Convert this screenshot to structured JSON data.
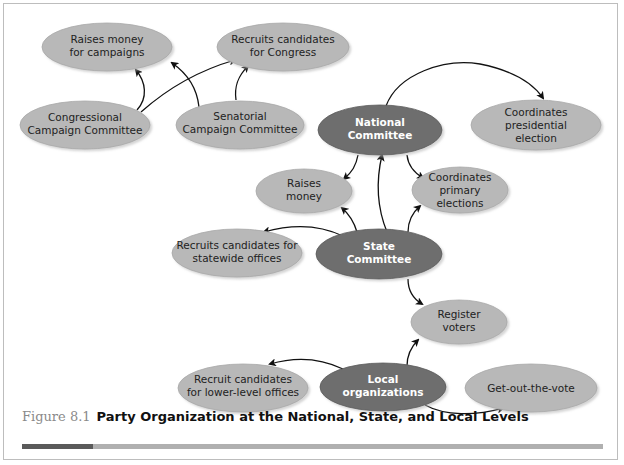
{
  "colors": {
    "light_node": "#b8b8b8",
    "light_node_edge": "#9a9a9a",
    "dark_node": "#6e6e6e",
    "dark_node_edge": "#555555",
    "arrow": "#111111",
    "caption_bar_dark": "#5a5a5a",
    "caption_bar_light": "#b0b0b0",
    "frame": "#bdbdbd"
  },
  "nodes": {
    "raises_money_campaigns": {
      "line1": "Raises money",
      "line2": "for campaigns"
    },
    "recruits_congress": {
      "line1": "Recruits candidates",
      "line2": "for Congress"
    },
    "congressional_committee": {
      "line1": "Congressional",
      "line2": "Campaign Committee"
    },
    "senatorial_committee": {
      "line1": "Senatorial",
      "line2": "Campaign Committee"
    },
    "national_committee": {
      "line1": "National",
      "line2": "Committee"
    },
    "coordinates_presidential": {
      "line1": "Coordinates",
      "line2": "presidential",
      "line3": "election"
    },
    "raises_money": {
      "line1": "Raises",
      "line2": "money"
    },
    "coordinates_primary": {
      "line1": "Coordinates",
      "line2": "primary",
      "line3": "elections"
    },
    "recruits_statewide": {
      "line1": "Recruits candidates for",
      "line2": "statewide offices"
    },
    "state_committee": {
      "line1": "State",
      "line2": "Committee"
    },
    "register_voters": {
      "line1": "Register",
      "line2": "voters"
    },
    "recruit_lower_level": {
      "line1": "Recruit candidates",
      "line2": "for lower-level offices"
    },
    "local_organizations": {
      "line1": "Local",
      "line2": "organizations"
    },
    "get_out_the_vote": {
      "line1": "Get-out-the-vote"
    }
  },
  "edges": [
    {
      "from": "Congressional Campaign Committee",
      "to": "Raises money for campaigns"
    },
    {
      "from": "Congressional Campaign Committee",
      "to": "Recruits candidates for Congress"
    },
    {
      "from": "Senatorial Campaign Committee",
      "to": "Raises money for campaigns"
    },
    {
      "from": "Senatorial Campaign Committee",
      "to": "Recruits candidates for Congress"
    },
    {
      "from": "National Committee",
      "to": "Coordinates presidential election"
    },
    {
      "from": "National Committee",
      "to": "Raises money"
    },
    {
      "from": "National Committee",
      "to": "Coordinates primary elections"
    },
    {
      "from": "State Committee",
      "to": "National Committee"
    },
    {
      "from": "State Committee",
      "to": "Raises money"
    },
    {
      "from": "State Committee",
      "to": "Coordinates primary elections"
    },
    {
      "from": "State Committee",
      "to": "Recruits candidates for statewide offices"
    },
    {
      "from": "State Committee",
      "to": "Register voters"
    },
    {
      "from": "Local organizations",
      "to": "Register voters"
    },
    {
      "from": "Local organizations",
      "to": "Recruit candidates for lower-level offices"
    },
    {
      "from": "Local organizations",
      "to": "Get-out-the-vote"
    }
  ],
  "caption": {
    "figure_number": "Figure 8.1",
    "title": "Party Organization at the National, State, and Local Levels"
  }
}
